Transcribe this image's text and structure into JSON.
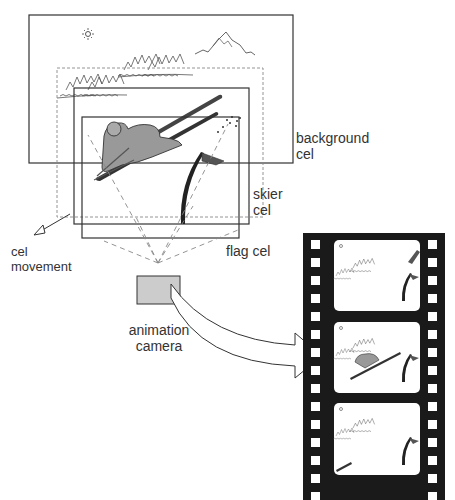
{
  "diagram": {
    "labels": {
      "background_cel": [
        "background",
        "cel"
      ],
      "skier_cel": [
        "skier",
        "cel"
      ],
      "flag_cel": "flag cel",
      "cel_movement": [
        "cel",
        "movement"
      ],
      "animation_camera": [
        "animation",
        "camera"
      ]
    },
    "layers": [
      {
        "name": "background cel",
        "contents": [
          "sun",
          "mountains",
          "trees"
        ]
      },
      {
        "name": "skier cel",
        "contents": [
          "skier"
        ]
      },
      {
        "name": "flag cel",
        "contents": [
          "flag"
        ]
      }
    ],
    "film_strip": {
      "frame_count": 3,
      "frames": [
        {
          "index": 1,
          "skier_position": "top-right, entering"
        },
        {
          "index": 2,
          "skier_position": "center"
        },
        {
          "index": 3,
          "skier_position": "bottom-left, leaving"
        }
      ]
    },
    "colors": {
      "line": "#333333",
      "camera_fill": "#cccccc",
      "film": "#1a1a1a",
      "skier_fill": "#999999"
    }
  }
}
